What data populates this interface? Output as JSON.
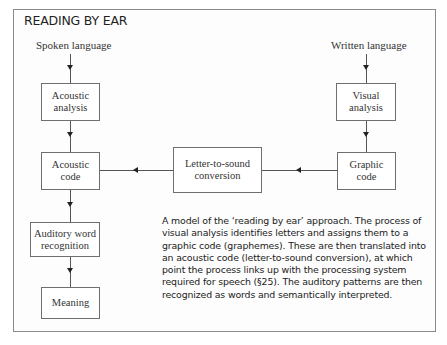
{
  "figure": {
    "title": "READING BY EAR",
    "inputs": {
      "spoken": "Spoken language",
      "written": "Written language"
    },
    "boxes": {
      "acoustic_analysis": [
        "Acoustic",
        "analysis"
      ],
      "acoustic_code": [
        "Acoustic",
        "code"
      ],
      "auditory_word_recognition": [
        "Auditory word",
        "recognition"
      ],
      "meaning": [
        "Meaning"
      ],
      "letter_to_sound": [
        "Letter-to-sound",
        "conversion"
      ],
      "visual_analysis": [
        "Visual",
        "analysis"
      ],
      "graphic_code": [
        "Graphic",
        "code"
      ]
    },
    "caption": "A model of the ‘reading by ear’ approach. The process of visual analysis identifies letters and assigns them to a graphic code (graphemes). These are then translated into an acoustic code (letter-to-sound conversion), at which point the process links up with the processing system required for speech (§25). The auditory patterns are then recognized as words and semantically interpreted."
  }
}
